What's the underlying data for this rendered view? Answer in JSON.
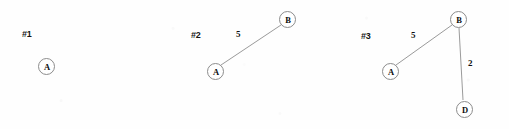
{
  "figure": {
    "background_color": "#fefefe",
    "node_stroke_color": "#8c8c8c",
    "edge_stroke_color": "#8f8f8f",
    "text_color": "#0d0d0d",
    "width": 509,
    "height": 129
  },
  "graphs": [
    {
      "id": "graph-1",
      "label": "#1",
      "label_x": 22,
      "label_y": 29,
      "nodes": [
        {
          "id": "A",
          "label": "A",
          "cx": 46,
          "cy": 66,
          "r": 8.5
        }
      ],
      "edges": []
    },
    {
      "id": "graph-2",
      "label": "#2",
      "label_x": 191,
      "label_y": 30,
      "nodes": [
        {
          "id": "A",
          "label": "A",
          "cx": 215,
          "cy": 71,
          "r": 8.5
        },
        {
          "id": "B",
          "label": "B",
          "cx": 287,
          "cy": 19,
          "r": 8.5
        }
      ],
      "edges": [
        {
          "from": "A",
          "to": "B",
          "weight": "5",
          "x1": 221,
          "y1": 65,
          "x2": 281,
          "y2": 25,
          "label_x": 236,
          "label_y": 29
        }
      ]
    },
    {
      "id": "graph-3",
      "label": "#3",
      "label_x": 361,
      "label_y": 31,
      "nodes": [
        {
          "id": "A",
          "label": "A",
          "cx": 390,
          "cy": 71,
          "r": 8.5
        },
        {
          "id": "B",
          "label": "B",
          "cx": 458,
          "cy": 19,
          "r": 8.5
        },
        {
          "id": "D",
          "label": "D",
          "cx": 464,
          "cy": 109,
          "r": 8.5
        }
      ],
      "edges": [
        {
          "from": "A",
          "to": "B",
          "weight": "5",
          "x1": 396,
          "y1": 65,
          "x2": 452,
          "y2": 25,
          "label_x": 411,
          "label_y": 30
        },
        {
          "from": "B",
          "to": "D",
          "weight": "2",
          "x1": 459,
          "y1": 28,
          "x2": 463,
          "y2": 100,
          "label_x": 468,
          "label_y": 58
        }
      ]
    }
  ]
}
